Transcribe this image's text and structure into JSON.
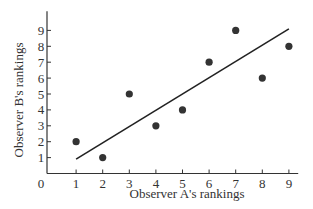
{
  "chart_data": {
    "type": "scatter",
    "title": "",
    "xlabel": "Observer A's rankings",
    "ylabel": "Observer B's rankings",
    "origin_label": "0",
    "x_ticks": [
      1,
      2,
      3,
      4,
      5,
      6,
      7,
      8,
      9
    ],
    "y_ticks": [
      1,
      2,
      3,
      4,
      5,
      6,
      7,
      8,
      9
    ],
    "xlim": [
      0,
      9.3
    ],
    "ylim": [
      0,
      9.8
    ],
    "grid": false,
    "series": [
      {
        "name": "rankings",
        "x": [
          1,
          2,
          3,
          4,
          5,
          6,
          7,
          8,
          9
        ],
        "y": [
          2,
          1,
          5,
          3,
          4,
          7,
          9,
          6,
          8
        ]
      }
    ],
    "regression_line": {
      "x": [
        1,
        9
      ],
      "y": [
        0.9,
        9.1
      ]
    },
    "colors": {
      "points": "#333333",
      "line": "#222222",
      "axis": "#333333"
    }
  }
}
